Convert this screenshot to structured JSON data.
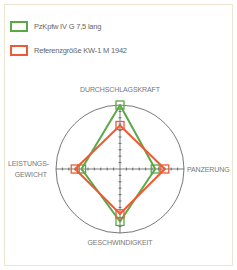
{
  "chart_data": {
    "type": "radar",
    "title": "",
    "axes": [
      "DURCHSCHLAGSKRAFT",
      "PANZERUNG",
      "GESCHWINDIGKEIT",
      "LEISTUNGS-GEWICHT"
    ],
    "range": [
      0,
      100
    ],
    "grid": "single outer circle with tick marks on axes",
    "legend_position": "top-left",
    "series": [
      {
        "name": "PzKpfw IV G 7,5 lang",
        "color": "#5aa845",
        "values": [
          100,
          55,
          82,
          60
        ]
      },
      {
        "name": "Referenzgröße KW-1 M 1942",
        "color": "#ee5a35",
        "values": [
          68,
          70,
          70,
          70
        ]
      }
    ]
  },
  "legend": {
    "items": [
      {
        "label": "PzKpfw IV G 7,5 lang",
        "color": "#5aa845"
      },
      {
        "label": "Referenzgröße KW-1 M 1942",
        "color": "#ee5a35"
      }
    ]
  },
  "axis_labels": {
    "top": "DURCHSCHLAGSKRAFT",
    "right": "PANZERUNG",
    "bottom": "GESCHWINDIGKEIT",
    "left_line1": "LEISTUNGS-",
    "left_line2": "GEWICHT"
  }
}
